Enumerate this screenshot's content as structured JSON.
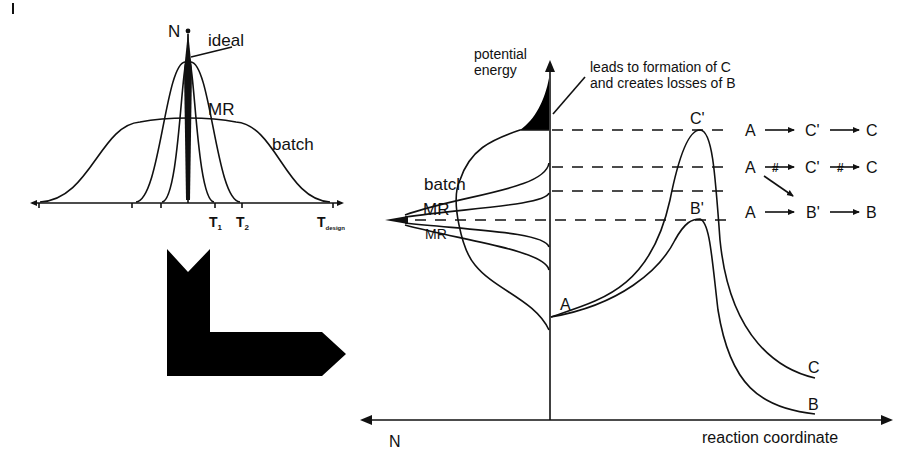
{
  "left_panel": {
    "y_axis_label": "N",
    "curve_labels": {
      "ideal": "ideal",
      "mr": "MR",
      "batch": "batch"
    },
    "x_ticks": {
      "t1": "T",
      "t1_sub": "1",
      "t2": "T",
      "t2_sub": "2",
      "tdesign": "T",
      "tdesign_sub": "design"
    }
  },
  "arrow": {
    "shape": "L-shaped arrow pointing right",
    "color": "#000000"
  },
  "right_panel": {
    "y_axis_label_line1": "potential",
    "y_axis_label_line2": "energy",
    "annotation_line1": "leads to formation of C",
    "annotation_line2": "and creates losses of B",
    "distribution_labels": {
      "batch": "batch",
      "mr": "MR"
    },
    "x_axis_label": "reaction coordinate",
    "left_axis_label": "N",
    "point_labels": {
      "a": "A",
      "c_prime": "C'",
      "b_prime": "B'",
      "c": "C",
      "b": "B"
    },
    "reactions": [
      {
        "from": "A",
        "mid": "C'",
        "to": "C",
        "blocked": false
      },
      {
        "from": "A",
        "mid": "C'",
        "to": "C",
        "blocked": true
      },
      {
        "from": "A",
        "mid": "B'",
        "to": "B",
        "blocked": false
      }
    ]
  },
  "colors": {
    "ink": "#111111",
    "background": "#ffffff"
  }
}
